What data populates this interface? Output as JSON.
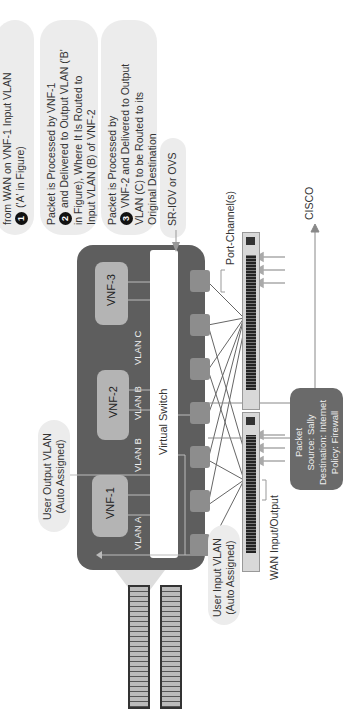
{
  "callouts": [
    {
      "number": "1",
      "lines": [
        "from WAN on VNF-1 Input VLAN",
        "('A' in Figure)"
      ]
    },
    {
      "number": "2",
      "lines": [
        "Packet is Processed by VNF-1",
        "and Delivered to Output VLAN ('B'",
        "in Figure), Where It Is Routed to",
        "Input VLAN (B) of VNF-2"
      ]
    },
    {
      "number": "3",
      "lines": [
        "Packet is Processed by",
        "VNF-2 and Delivered to Output",
        "VLAN (C) to be Routed to its",
        "Original Destination"
      ]
    }
  ],
  "labels": {
    "sriov": "SR-IOV or OVS",
    "port_channel": "Port-Channel(s)",
    "cisco": "CISCO",
    "wan_io": "WAN Input/Output",
    "user_output_vlan": [
      "User Output VLAN",
      "(Auto Assigned)"
    ],
    "user_input_vlan": [
      "User Input VLAN",
      "(Auto Assigned)"
    ],
    "virtual_switch": "Virtual Switch"
  },
  "vnfs": [
    {
      "name": "VNF-3"
    },
    {
      "name": "VNF-2"
    },
    {
      "name": "VNF-1"
    }
  ],
  "vlans": {
    "c": "VLAN C",
    "b_in": "VLAN B",
    "b_out": "VLAN B",
    "a": "VLAN A"
  },
  "packet": {
    "lines": [
      "Packet",
      "Source: Sally",
      "Destination: Internet",
      "Policy: Firewall"
    ]
  },
  "colors": {
    "host": "#5e5e5e",
    "vnf": "#b4b4b4",
    "callout_bg": "#ececec",
    "packet_bg": "#6a6a6a"
  }
}
